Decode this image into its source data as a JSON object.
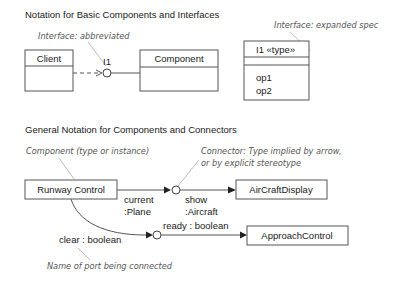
{
  "section1": {
    "heading": "Notation for Basic Components and Interfaces",
    "note_abbrev": "Interface: abbreviated",
    "note_expanded": "Interface: expanded spec",
    "client_box": {
      "name": "Client"
    },
    "component_box": {
      "name": "Component"
    },
    "interface_label": "I1",
    "interface_spec": {
      "header": "I1 «type»",
      "operations": [
        "op1",
        "op2"
      ]
    }
  },
  "section2": {
    "heading": "General Notation for Components and Connectors",
    "note_component": "Component (type or instance)",
    "note_connector_line1": "Connector: Type implied by arrow,",
    "note_connector_line2": "or by explicit stereotype",
    "note_port": "Name of port being connected",
    "runway_box": {
      "name": "Runway Control"
    },
    "aircraft_box": {
      "name": "AirCraftDisplay"
    },
    "approach_box": {
      "name": "ApproachControl"
    },
    "port_current_1": "current",
    "port_current_2": ":Plane",
    "port_show_1": "show",
    "port_show_2": ":Aircraft",
    "port_ready": "ready : boolean",
    "port_clear": "clear : boolean"
  }
}
